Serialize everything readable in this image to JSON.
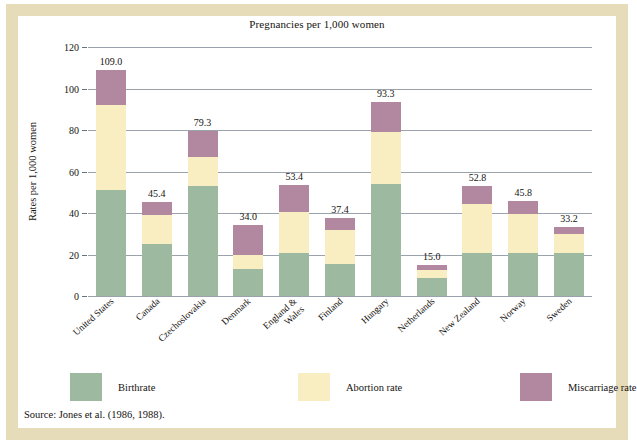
{
  "figure": {
    "title": "Pregnancies per 1,000 women",
    "source": "Source: Jones et al. (1986, 1988).",
    "frame_color": "#e6dcb9",
    "background": "#ffffff"
  },
  "legend": {
    "items": [
      {
        "label": "Birthrate",
        "color": "#9db99f"
      },
      {
        "label": "Abortion rate",
        "color": "#f8eec2"
      },
      {
        "label": "Miscarriage rate",
        "color": "#b288a0"
      }
    ]
  },
  "chart_data": {
    "type": "bar",
    "subtype": "stacked",
    "title": "Pregnancies per 1,000 women",
    "xlabel": "",
    "ylabel": "Rates per 1,000 women",
    "ylim": [
      0,
      120
    ],
    "yticks": [
      0,
      20,
      40,
      60,
      80,
      100,
      120
    ],
    "ytick_labels": [
      "0",
      "20",
      "40",
      "60",
      "80",
      "100",
      "120"
    ],
    "grid": true,
    "legend_position": "bottom",
    "categories": [
      "United States",
      "Canada",
      "Czechoslovakia",
      "Denmark",
      "England &\nWales",
      "Finland",
      "Hungary",
      "Netherlands",
      "New Zealand",
      "Norway",
      "Sweden"
    ],
    "series": [
      {
        "name": "Birthrate",
        "color": "#9db99f",
        "values": [
          51.0,
          25.0,
          53.0,
          13.0,
          20.5,
          15.5,
          54.0,
          8.8,
          20.5,
          20.5,
          20.5
        ]
      },
      {
        "name": "Abortion rate",
        "color": "#f8eec2",
        "values": [
          41.0,
          14.0,
          14.0,
          7.0,
          20.0,
          16.5,
          25.0,
          3.7,
          24.0,
          19.0,
          9.5
        ]
      },
      {
        "name": "Miscarriage rate",
        "color": "#b288a0",
        "values": [
          17.0,
          6.4,
          12.3,
          14.0,
          12.9,
          5.4,
          14.3,
          2.5,
          8.3,
          6.3,
          3.2
        ]
      }
    ],
    "totals": [
      109.0,
      45.4,
      79.3,
      34.0,
      53.4,
      37.4,
      93.3,
      15.0,
      52.8,
      45.8,
      33.2
    ],
    "total_labels": [
      "109.0",
      "45.4",
      "79.3",
      "34.0",
      "53.4",
      "37.4",
      "93.3",
      "15.0",
      "52.8",
      "45.8",
      "33.2"
    ]
  }
}
